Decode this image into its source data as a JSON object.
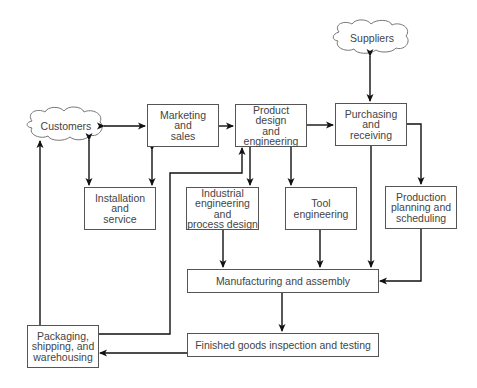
{
  "diagram": {
    "type": "flowchart",
    "nodes": {
      "customers": {
        "label": "Customers",
        "shape": "cloud"
      },
      "suppliers": {
        "label": "Suppliers",
        "shape": "cloud"
      },
      "marketing": {
        "label": "Marketing\nand\nsales",
        "shape": "box"
      },
      "product_design": {
        "label": "Product design\nand\nengineering",
        "shape": "box"
      },
      "purchasing": {
        "label": "Purchasing\nand\nreceiving",
        "shape": "box"
      },
      "installation": {
        "label": "Installation\nand\nservice",
        "shape": "box"
      },
      "industrial_eng": {
        "label": "Industrial\nengineering and\nprocess design",
        "shape": "box"
      },
      "tool_eng": {
        "label": "Tool\nengineering",
        "shape": "box"
      },
      "production_planning": {
        "label": "Production\nplanning and\nscheduling",
        "shape": "box"
      },
      "manufacturing": {
        "label": "Manufacturing and assembly",
        "shape": "box"
      },
      "inspection": {
        "label": "Finished goods inspection and testing",
        "shape": "box"
      },
      "packaging": {
        "label": "Packaging,\nshipping, and\nwarehousing",
        "shape": "box"
      }
    },
    "edges": [
      {
        "from": "customers",
        "to": "marketing",
        "bidirectional": true
      },
      {
        "from": "customers",
        "to": "installation",
        "bidirectional": true
      },
      {
        "from": "marketing",
        "to": "installation",
        "bidirectional": true
      },
      {
        "from": "marketing",
        "to": "product_design",
        "bidirectional": false
      },
      {
        "from": "product_design",
        "to": "purchasing",
        "bidirectional": false
      },
      {
        "from": "suppliers",
        "to": "purchasing",
        "bidirectional": true
      },
      {
        "from": "product_design",
        "to": "industrial_eng",
        "bidirectional": false
      },
      {
        "from": "product_design",
        "to": "tool_eng",
        "bidirectional": false
      },
      {
        "from": "purchasing",
        "to": "production_planning",
        "bidirectional": false
      },
      {
        "from": "purchasing",
        "to": "manufacturing",
        "bidirectional": false
      },
      {
        "from": "industrial_eng",
        "to": "manufacturing",
        "bidirectional": false
      },
      {
        "from": "tool_eng",
        "to": "manufacturing",
        "bidirectional": false
      },
      {
        "from": "production_planning",
        "to": "manufacturing",
        "bidirectional": false
      },
      {
        "from": "manufacturing",
        "to": "inspection",
        "bidirectional": false
      },
      {
        "from": "inspection",
        "to": "packaging",
        "bidirectional": false
      },
      {
        "from": "packaging",
        "to": "customers",
        "bidirectional": false
      },
      {
        "from": "packaging",
        "to": "product_design",
        "bidirectional": false
      }
    ]
  }
}
